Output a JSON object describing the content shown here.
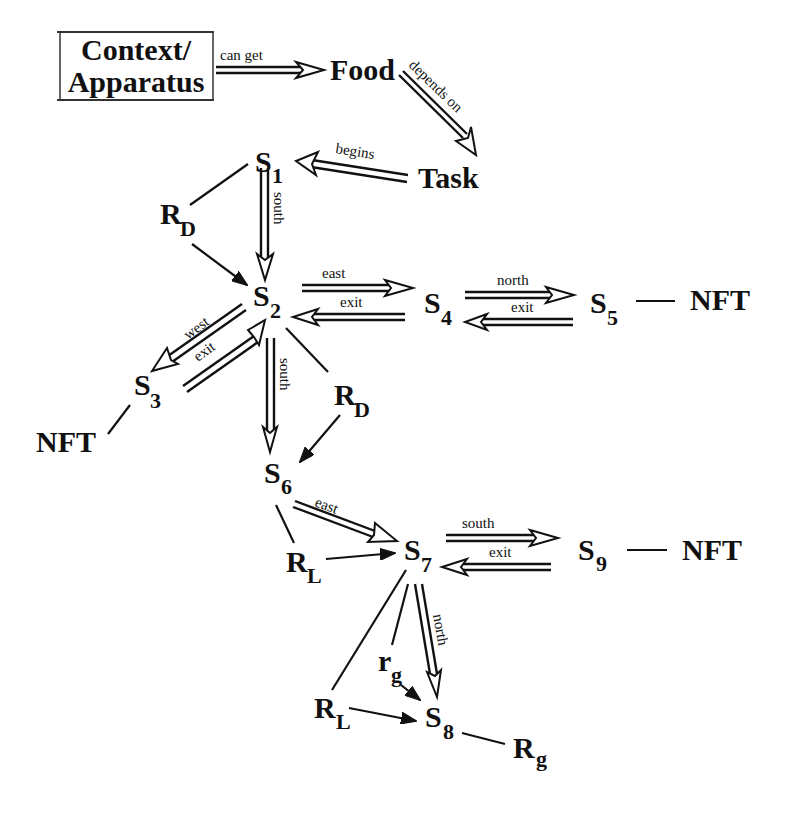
{
  "diagram": {
    "title_box": {
      "line1": "Context/",
      "line2": "Apparatus"
    },
    "nodes": {
      "food": "Food",
      "task": "Task",
      "s1": {
        "base": "S",
        "sub": "1"
      },
      "s2": {
        "base": "S",
        "sub": "2"
      },
      "s3": {
        "base": "S",
        "sub": "3"
      },
      "s4": {
        "base": "S",
        "sub": "4"
      },
      "s5": {
        "base": "S",
        "sub": "5"
      },
      "s6": {
        "base": "S",
        "sub": "6"
      },
      "s7": {
        "base": "S",
        "sub": "7"
      },
      "s8": {
        "base": "S",
        "sub": "8"
      },
      "s9": {
        "base": "S",
        "sub": "9"
      },
      "rd_upper": {
        "base": "R",
        "sub": "D"
      },
      "rd_lower": {
        "base": "R",
        "sub": "D"
      },
      "rl_upper": {
        "base": "R",
        "sub": "L"
      },
      "rl_lower": {
        "base": "R",
        "sub": "L"
      },
      "rg_small": {
        "base": "r",
        "sub": "g"
      },
      "rg_big": {
        "base": "R",
        "sub": "g"
      },
      "nft_s5": "NFT",
      "nft_s3": "NFT",
      "nft_s9": "NFT"
    },
    "edges": {
      "context_food": "can get",
      "food_task": "depends on",
      "task_s1": "begins",
      "s1_s2": "south",
      "s2_s4": "east",
      "s4_s2": "exit",
      "s4_s5": "north",
      "s5_s4": "exit",
      "s2_s3": "west",
      "s3_s2": "exit",
      "s2_s6": "south",
      "s6_s7": "east",
      "s7_s9": "south",
      "s9_s7": "exit",
      "s7_s8": "north"
    }
  }
}
